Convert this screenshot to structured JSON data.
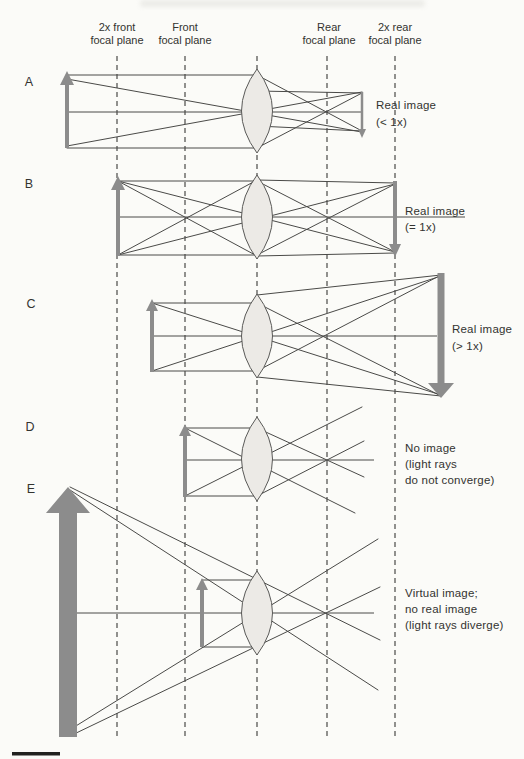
{
  "figure": {
    "type": "lens-ray-diagram",
    "plane_labels": [
      {
        "line1": "2x front",
        "line2": "focal plane"
      },
      {
        "line1": "Front",
        "line2": "focal plane"
      },
      {
        "line1": "Rear",
        "line2": "focal plane"
      },
      {
        "line1": "2x rear",
        "line2": "focal plane"
      }
    ],
    "rows": [
      {
        "letter": "A",
        "caption": [
          "Real image",
          "(< 1x)"
        ]
      },
      {
        "letter": "B",
        "caption": [
          "Real image",
          "(= 1x)"
        ]
      },
      {
        "letter": "C",
        "caption": [
          "Real image",
          "(> 1x)"
        ]
      },
      {
        "letter": "D",
        "caption": [
          "No image",
          "(light rays",
          "do not converge)"
        ]
      },
      {
        "letter": "E",
        "caption": [
          "Virtual image;",
          "no real image",
          "(light rays diverge)"
        ]
      }
    ],
    "colors": {
      "arrow_gray": "#8c8c8c",
      "ray": "#4a4a48",
      "dashed_plane": "#4a4a48",
      "lens_fill": "#eceae6",
      "lens_stroke": "#5a5a58",
      "text": "#333330",
      "scale_bar": "#222220",
      "background": "#fbfbf8"
    }
  }
}
